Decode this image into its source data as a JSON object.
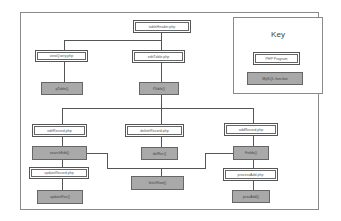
{
  "diagram": {
    "type": "program-structure-chart",
    "colors": {
      "php_box_fill": "#ffffff",
      "sql_box_fill": "#a9a9a9",
      "line": "#555555",
      "frame": "#8a8a8a"
    },
    "key": {
      "title": "Key",
      "php_label": "PHP Program",
      "sql_label": "MySQL function"
    },
    "nodes": {
      "root": "tableHeader.php",
      "viewQuery": "viewQuery.php",
      "editTable": "editTable.php",
      "qTable": "qTable()",
      "fTable": "fTable()",
      "editRecord": "editRecord.php",
      "deleteRecord": "deleteRecord.php",
      "addRecord": "addRecord.php",
      "searchEdit": "searchEdit()",
      "delRec": "delRec()",
      "fields": "Fields()",
      "updateRecord": "updateRecord.php",
      "fetchRow": "fetchRow()",
      "processAdd": "processAdd.php",
      "updateRec": "updateRec()",
      "procAdd": "procAdd()"
    },
    "edges": [
      [
        "root",
        "viewQuery"
      ],
      [
        "root",
        "editTable"
      ],
      [
        "viewQuery",
        "qTable"
      ],
      [
        "editTable",
        "fTable"
      ],
      [
        "fTable",
        "editRecord"
      ],
      [
        "fTable",
        "deleteRecord"
      ],
      [
        "fTable",
        "addRecord"
      ],
      [
        "editRecord",
        "searchEdit"
      ],
      [
        "deleteRecord",
        "delRec"
      ],
      [
        "addRecord",
        "fields"
      ],
      [
        "searchEdit",
        "fetchRow"
      ],
      [
        "fields",
        "fetchRow"
      ],
      [
        "searchEdit",
        "updateRecord"
      ],
      [
        "updateRecord",
        "updateRec"
      ],
      [
        "fields",
        "processAdd"
      ],
      [
        "processAdd",
        "procAdd"
      ]
    ]
  }
}
